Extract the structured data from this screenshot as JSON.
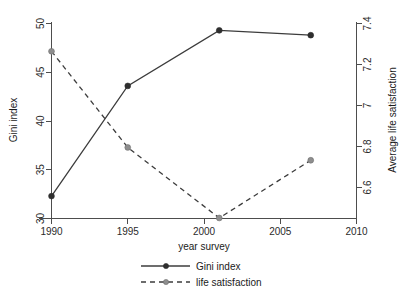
{
  "chart_data": {
    "type": "line",
    "title": "",
    "xlabel": "year survey",
    "ylabel": "Gini index",
    "y2label": "Average life satisfaction",
    "x": [
      1990,
      1995,
      2001,
      2007
    ],
    "xlim": [
      1990,
      2010
    ],
    "ylim": [
      30,
      50
    ],
    "y2lim": [
      6.4875,
      7.4
    ],
    "grid": false,
    "legend_position": "bottom-center",
    "xticks": [
      "1990",
      "1995",
      "2000",
      "2005",
      "2010"
    ],
    "xtick_values": [
      1990,
      1995,
      2000,
      2005,
      2010
    ],
    "yticks": [
      "30",
      "35",
      "40",
      "45",
      "50"
    ],
    "ytick_values": [
      30,
      35,
      40,
      45,
      50
    ],
    "y2ticks": [
      "6.6",
      "6.8",
      "7",
      "7.2",
      "7.4"
    ],
    "y2tick_values": [
      6.6,
      6.8,
      7,
      7.2,
      7.4
    ],
    "series": [
      {
        "name": "Gini index",
        "axis": "left",
        "style": "solid",
        "marker": "filled-circle",
        "color": "#3c3c3c",
        "x": [
          1990,
          1995,
          2001,
          2007
        ],
        "values": [
          32.3,
          43.6,
          49.3,
          48.8
        ]
      },
      {
        "name": "life satisfaction",
        "axis": "right",
        "style": "dashed",
        "marker": "gray-circle",
        "color": "#8e8e8e",
        "x": [
          1990,
          1995,
          2001,
          2007
        ],
        "values": [
          7.27,
          6.82,
          6.49,
          6.76
        ]
      }
    ]
  },
  "legend": {
    "items": [
      {
        "label": "Gini index"
      },
      {
        "label": "life satisfaction"
      }
    ]
  },
  "axes": {
    "x_title": "year survey",
    "y_left_title": "Gini index",
    "y_right_title": "Average life satisfaction"
  }
}
